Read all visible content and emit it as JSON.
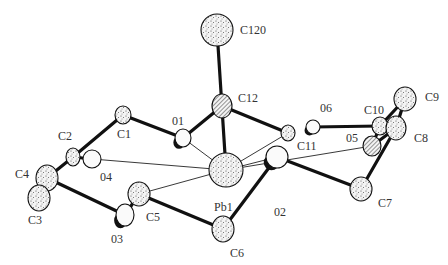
{
  "diagram": {
    "type": "ORTEP molecular structure",
    "colors": {
      "bond": "#111111",
      "atom_fill": "#f2f2f2",
      "stipple": "#444444",
      "thin_bond": "#222222",
      "label": "#333333"
    },
    "atoms": [
      {
        "id": "C120",
        "label": "C120",
        "x": 217,
        "y": 30,
        "rx": 16,
        "ry": 16,
        "style": "stippled",
        "lx": 240,
        "ly": 34
      },
      {
        "id": "C12",
        "label": "C12",
        "x": 222,
        "y": 106,
        "rx": 10,
        "ry": 12,
        "style": "hatched",
        "lx": 238,
        "ly": 102
      },
      {
        "id": "O1",
        "label": "01",
        "x": 183,
        "y": 138,
        "rx": 8,
        "ry": 9,
        "style": "octant",
        "lx": 172,
        "ly": 125
      },
      {
        "id": "C1",
        "label": "C1",
        "x": 123,
        "y": 115,
        "rx": 8,
        "ry": 9,
        "style": "stippled",
        "lx": 117,
        "ly": 138
      },
      {
        "id": "C2",
        "label": "C2",
        "x": 73,
        "y": 157,
        "rx": 7,
        "ry": 9,
        "style": "stippled",
        "lx": 58,
        "ly": 140
      },
      {
        "id": "O4",
        "label": "04",
        "x": 92,
        "y": 159,
        "rx": 9,
        "ry": 9,
        "style": "open",
        "lx": 100,
        "ly": 181
      },
      {
        "id": "C4",
        "label": "C4",
        "x": 47,
        "y": 178,
        "rx": 11,
        "ry": 13,
        "style": "stippled",
        "lx": 15,
        "ly": 178
      },
      {
        "id": "C3",
        "label": "C3",
        "x": 39,
        "y": 198,
        "rx": 11,
        "ry": 13,
        "style": "stippled",
        "lx": 28,
        "ly": 224
      },
      {
        "id": "C5",
        "label": "C5",
        "x": 139,
        "y": 194,
        "rx": 11,
        "ry": 12,
        "style": "stippled",
        "lx": 146,
        "ly": 221
      },
      {
        "id": "O3",
        "label": "03",
        "x": 125,
        "y": 215,
        "rx": 9,
        "ry": 11,
        "style": "octant",
        "lx": 111,
        "ly": 243
      },
      {
        "id": "Pb1",
        "label": "Pb1",
        "x": 226,
        "y": 170,
        "rx": 17,
        "ry": 17,
        "style": "stippled",
        "lx": 214,
        "ly": 211
      },
      {
        "id": "C6",
        "label": "C6",
        "x": 223,
        "y": 229,
        "rx": 11,
        "ry": 13,
        "style": "stippled",
        "lx": 230,
        "ly": 257
      },
      {
        "id": "O2",
        "label": "02",
        "x": 277,
        "y": 157,
        "rx": 11,
        "ry": 11,
        "style": "octant",
        "lx": 274,
        "ly": 216
      },
      {
        "id": "C7",
        "label": "C7",
        "x": 361,
        "y": 189,
        "rx": 11,
        "ry": 12,
        "style": "stippled",
        "lx": 378,
        "ly": 207
      },
      {
        "id": "C11",
        "label": "C11",
        "x": 288,
        "y": 133,
        "rx": 7,
        "ry": 8,
        "style": "stippled",
        "lx": 297,
        "ly": 150
      },
      {
        "id": "O6",
        "label": "06",
        "x": 313,
        "y": 127,
        "rx": 7,
        "ry": 7,
        "style": "octant",
        "lx": 320,
        "ly": 112
      },
      {
        "id": "C10",
        "label": "C10",
        "x": 380,
        "y": 126,
        "rx": 8,
        "ry": 9,
        "style": "stippled",
        "lx": 364,
        "ly": 114
      },
      {
        "id": "C9",
        "label": "C9",
        "x": 405,
        "y": 99,
        "rx": 11,
        "ry": 12,
        "style": "stippled",
        "lx": 425,
        "ly": 101
      },
      {
        "id": "C8",
        "label": "C8",
        "x": 396,
        "y": 128,
        "rx": 10,
        "ry": 12,
        "style": "stippled",
        "lx": 414,
        "ly": 142
      },
      {
        "id": "O5",
        "label": "05",
        "x": 372,
        "y": 146,
        "rx": 9,
        "ry": 10,
        "style": "hatched",
        "lx": 346,
        "ly": 142
      }
    ],
    "bonds": [
      {
        "a": "C120",
        "b": "Pb1",
        "w": 3
      },
      {
        "a": "C12",
        "b": "O1",
        "w": 3
      },
      {
        "a": "C12",
        "b": "C11",
        "w": 3
      },
      {
        "a": "O1",
        "b": "C1",
        "w": 3
      },
      {
        "a": "C1",
        "b": "C2",
        "w": 3
      },
      {
        "a": "C2",
        "b": "O4",
        "w": 3
      },
      {
        "a": "C2",
        "b": "C4",
        "w": 3
      },
      {
        "a": "C4",
        "b": "C3",
        "w": 3
      },
      {
        "a": "C4",
        "b": "O3",
        "w": 3
      },
      {
        "a": "O3",
        "b": "C5",
        "w": 3
      },
      {
        "a": "C5",
        "b": "C6",
        "w": 3
      },
      {
        "a": "C6",
        "b": "O2",
        "w": 3
      },
      {
        "a": "O2",
        "b": "C7",
        "w": 3
      },
      {
        "a": "C7",
        "b": "C8",
        "w": 3
      },
      {
        "a": "C8",
        "b": "C9",
        "w": 3
      },
      {
        "a": "C10",
        "b": "C9",
        "w": 3
      },
      {
        "a": "O5",
        "b": "C8",
        "w": 3
      },
      {
        "a": "O5",
        "b": "C10",
        "w": 3
      },
      {
        "a": "O6",
        "b": "C10",
        "w": 3
      },
      {
        "a": "Pb1",
        "b": "O1",
        "w": 1
      },
      {
        "a": "Pb1",
        "b": "O4",
        "w": 1
      },
      {
        "a": "Pb1",
        "b": "C5",
        "w": 1
      },
      {
        "a": "Pb1",
        "b": "O2",
        "w": 1
      },
      {
        "a": "Pb1",
        "b": "O5",
        "w": 1
      },
      {
        "a": "Pb1",
        "b": "C11",
        "w": 1
      }
    ]
  }
}
